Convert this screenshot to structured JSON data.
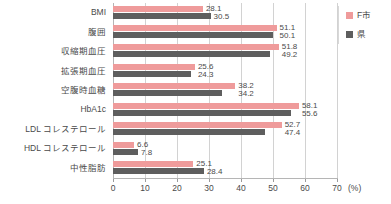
{
  "chart_data": {
    "type": "bar",
    "orientation": "horizontal",
    "title": "",
    "xlabel": "(%)",
    "ylabel": "",
    "xlim": [
      0,
      70
    ],
    "xticks": [
      0,
      10,
      20,
      30,
      40,
      50,
      60,
      70
    ],
    "xtick_labels": [
      "0",
      "10",
      "20",
      "30",
      "40",
      "50",
      "60",
      "70"
    ],
    "unit_label": "(%)",
    "grid": true,
    "grid_axis": "x",
    "legend_position": "right-top",
    "categories": [
      "BMI",
      "腹囲",
      "収縮期血圧",
      "拡張期血圧",
      "空腹時血糖",
      "HbA1c",
      "LDL コレステロール",
      "HDL コレステロール",
      "中性脂肪"
    ],
    "series": [
      {
        "name": "F市",
        "color": "#ef9b9b",
        "values": [
          28.1,
          51.1,
          51.8,
          25.6,
          38.2,
          58.1,
          52.7,
          6.6,
          25.1
        ],
        "value_labels": [
          "28.1",
          "51.1",
          "51.8",
          "25.6",
          "38.2",
          "58.1",
          "52.7",
          "6.6",
          "25.1"
        ]
      },
      {
        "name": "県",
        "color": "#5e5e5e",
        "values": [
          30.5,
          50.1,
          49.2,
          24.3,
          34.2,
          55.6,
          47.4,
          7.8,
          28.4
        ],
        "value_labels": [
          "30.5",
          "50.1",
          "49.2",
          "24.3",
          "34.2",
          "55.6",
          "47.4",
          "7.8",
          "28.4"
        ]
      }
    ]
  },
  "legend": {
    "items": [
      {
        "label": "F市",
        "color": "#ef9b9b"
      },
      {
        "label": "県",
        "color": "#5e5e5e"
      }
    ]
  }
}
